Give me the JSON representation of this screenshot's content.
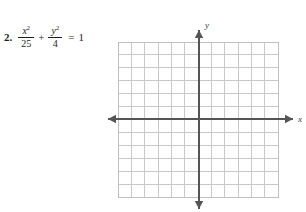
{
  "problem": {
    "number_label": "2.",
    "term1": {
      "numerator_base": "x",
      "numerator_exp": "2",
      "denominator": "25"
    },
    "operator": "+",
    "term2": {
      "numerator_base": "y",
      "numerator_exp": "2",
      "denominator": "4"
    },
    "equals": "=",
    "right_side": "1",
    "full_text": "2.  x²/25 + y²/4 = 1"
  },
  "graph": {
    "x_axis_label": "x",
    "y_axis_label": "y",
    "grid": {
      "columns": 12,
      "rows": 12,
      "cell_size": 13,
      "left": 10,
      "top": 34,
      "right": 170,
      "bottom": 189,
      "line_color": "#c9c9cd",
      "grid_visible": true
    },
    "axes": {
      "origin_x": 91,
      "origin_y": 111,
      "color": "#555558",
      "x_start": 0,
      "x_end": 185,
      "y_start": 22,
      "y_end": 201,
      "arrowheads": [
        "left",
        "right",
        "up",
        "down"
      ]
    },
    "tick_labels": [],
    "plotted_curve": null
  },
  "chart_data": {
    "type": "scatter",
    "title": "",
    "xlabel": "x",
    "ylabel": "y",
    "xlim": [
      -6,
      6
    ],
    "ylim": [
      -6,
      6
    ],
    "grid": true,
    "legend": false,
    "series": [],
    "annotations": [],
    "note": "Blank coordinate grid, 12 by 12 cells, axes through center, no plotted data"
  }
}
